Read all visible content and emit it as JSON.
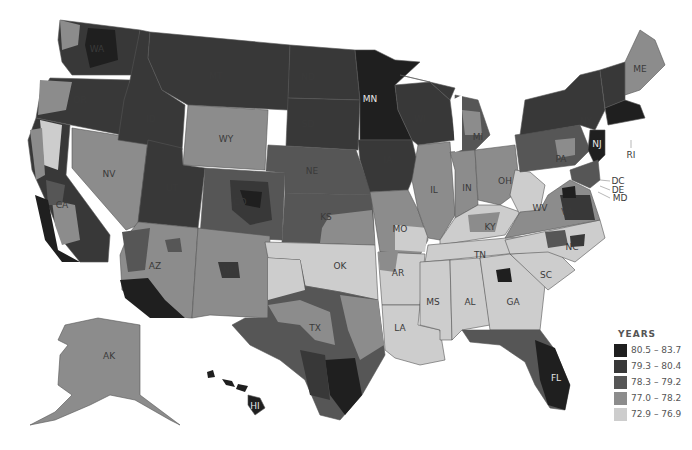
{
  "map": {
    "type": "choropleth",
    "subject": "Life expectancy by region",
    "palette": {
      "bin1": "#1f1f1f",
      "bin2": "#383838",
      "bin3": "#565656",
      "bin4": "#8c8c8c",
      "bin5": "#cdcdcd"
    },
    "state_labels": {
      "WA": "WA",
      "OR": "OR",
      "CA": "CA",
      "NV": "NV",
      "ID": "ID",
      "MT": "MT",
      "WY": "WY",
      "UT": "UT",
      "CO": "CO",
      "AZ": "AZ",
      "NM": "NM",
      "ND": "ND",
      "SD": "SD",
      "NE": "NE",
      "KS": "KS",
      "OK": "OK",
      "TX": "TX",
      "MN": "MN",
      "IA": "IA",
      "MO": "MO",
      "AR": "AR",
      "LA": "LA",
      "WI": "WI",
      "IL": "IL",
      "MI": "MI",
      "IN": "IN",
      "OH": "OH",
      "KY": "KY",
      "TN": "TN",
      "MS": "MS",
      "AL": "AL",
      "GA": "GA",
      "FL": "FL",
      "SC": "SC",
      "NC": "NC",
      "VA": "VA",
      "WV": "WV",
      "PA": "PA",
      "NY": "NY",
      "VT": "VT",
      "NH": "NH",
      "ME": "ME",
      "MA": "MA",
      "CT": "CT",
      "NJ": "NJ",
      "RI": "RI",
      "DC": "DC",
      "DE": "DE",
      "MD": "MD",
      "AK": "AK",
      "HI": "HI"
    }
  },
  "legend": {
    "title": "YEARS",
    "items": [
      {
        "range": "80.5 – 83.7",
        "color": "#1f1f1f"
      },
      {
        "range": "79.3 – 80.4",
        "color": "#383838"
      },
      {
        "range": "78.3 – 79.2",
        "color": "#565656"
      },
      {
        "range": "77.0 – 78.2",
        "color": "#8c8c8c"
      },
      {
        "range": "72.9 – 76.9",
        "color": "#cdcdcd"
      }
    ]
  }
}
